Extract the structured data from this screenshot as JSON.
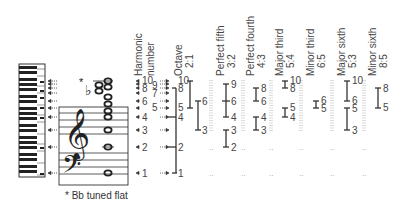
{
  "diagram": {
    "footnote": "* Bb tuned flat",
    "flat_marker": "*",
    "harmonic_header": [
      "Harmonic",
      "number"
    ],
    "harmonics": [
      "1",
      "2",
      "3",
      "4",
      "5",
      "6",
      "7",
      "8",
      "9",
      "10"
    ],
    "columns": [
      {
        "name": "Octave",
        "ratio": "2:1",
        "spans": [
          [
            "1",
            "8"
          ],
          [
            "5",
            "10"
          ],
          [
            "3",
            "6"
          ]
        ]
      },
      {
        "name": "Perfect fifth",
        "ratio": "3:2",
        "spans": [
          [
            "6",
            "9"
          ],
          [
            "4",
            "6"
          ],
          [
            "2",
            "3"
          ]
        ]
      },
      {
        "name": "Perfect fourth",
        "ratio": "4:3",
        "spans": [
          [
            "6",
            "8"
          ],
          [
            "3",
            "4"
          ]
        ]
      },
      {
        "name": "Major third",
        "ratio": "5:4",
        "spans": [
          [
            "8",
            "10"
          ],
          [
            "4",
            "5"
          ]
        ]
      },
      {
        "name": "Minor third",
        "ratio": "6:5",
        "spans": [
          [
            "5",
            "6"
          ]
        ]
      },
      {
        "name": "Major sixth",
        "ratio": "5:3",
        "spans": [
          [
            "6",
            "10"
          ],
          [
            "3",
            "5"
          ]
        ]
      },
      {
        "name": "Minor sixth",
        "ratio": "8:5",
        "spans": [
          [
            "5",
            "8"
          ]
        ]
      }
    ],
    "octave_labels": {
      "main": [
        "1",
        "2",
        "4",
        "8"
      ],
      "upper": [
        "5",
        "10"
      ],
      "side": [
        "3",
        "6"
      ]
    },
    "pfifth_labels": [
      "9",
      "6",
      "4",
      "3",
      "2"
    ],
    "pfourth_labels": [
      "8",
      "6",
      "4",
      "3"
    ],
    "mthird_labels": [
      "10",
      "8",
      "5",
      "4"
    ],
    "minthird_labels": [
      "6",
      "5"
    ],
    "msixth_labels": [
      "10",
      "6",
      "5",
      "3"
    ],
    "minsixth_labels": [
      "8",
      "5"
    ]
  }
}
